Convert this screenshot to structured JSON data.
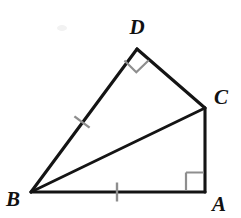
{
  "figure": {
    "kind": "geometry-diagram",
    "background_color": "#ffffff",
    "stroke_color": "#141414",
    "mark_color": "#8e8e8e",
    "vertices": [
      {
        "id": "A",
        "label": "A",
        "x": 205,
        "y": 192,
        "label_x": 219,
        "label_y": 210
      },
      {
        "id": "B",
        "label": "B",
        "x": 31,
        "y": 192,
        "label_x": 13,
        "label_y": 205
      },
      {
        "id": "C",
        "label": "C",
        "x": 205,
        "y": 108,
        "label_x": 221,
        "label_y": 104
      },
      {
        "id": "D",
        "label": "D",
        "x": 137,
        "y": 49,
        "label_x": 137,
        "label_y": 34
      }
    ],
    "segments": [
      {
        "id": "BD",
        "from": "B",
        "to": "D"
      },
      {
        "id": "DC",
        "from": "D",
        "to": "C"
      },
      {
        "id": "CA",
        "from": "C",
        "to": "A"
      },
      {
        "id": "AB",
        "from": "A",
        "to": "B"
      },
      {
        "id": "BC",
        "from": "B",
        "to": "C"
      }
    ],
    "right_angles": [
      {
        "id": "angle-D",
        "at": "D",
        "between": [
          "B",
          "C"
        ],
        "size": 17
      },
      {
        "id": "angle-A",
        "at": "A",
        "between": [
          "C",
          "B"
        ],
        "size": 19
      }
    ],
    "congruence_ticks": [
      {
        "id": "tick-BD",
        "on_segment": "BD",
        "count": 1,
        "x": 82,
        "y": 122,
        "length": 19,
        "angle_deg": 53.5
      },
      {
        "id": "tick-BA",
        "on_segment": "AB",
        "count": 1,
        "x": 117,
        "y": 192,
        "length": 19,
        "angle_deg": 90
      }
    ]
  }
}
